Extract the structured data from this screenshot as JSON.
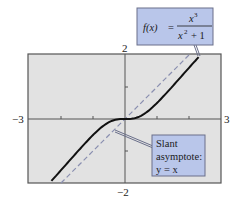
{
  "chart_data": {
    "type": "line",
    "title": "",
    "xlabel": "",
    "ylabel": "",
    "xlim": [
      -3,
      3
    ],
    "ylim": [
      -2,
      2
    ],
    "grid": false,
    "tick_labels": {
      "x_min": "−3",
      "x_max": "3",
      "y_max": "2",
      "y_min": "−2"
    },
    "x_ticks": [
      -3,
      -2,
      -1,
      0,
      1,
      2,
      3
    ],
    "y_ticks": [
      -2,
      -1,
      0,
      1,
      2
    ],
    "series": [
      {
        "name": "f(x) = x^3/(x^2+1)",
        "style": "solid",
        "color": "#111111",
        "x": [
          -2.3,
          -2.0,
          -1.5,
          -1.0,
          -0.5,
          0.0,
          0.5,
          1.0,
          1.5,
          2.0,
          2.3
        ],
        "values": [
          -1.93,
          -1.6,
          -1.04,
          -0.5,
          -0.1,
          0.0,
          0.1,
          0.5,
          1.04,
          1.6,
          1.93
        ]
      },
      {
        "name": "Slant asymptote: y = x",
        "style": "dashed",
        "color": "#8a8fb0",
        "x": [
          -2.0,
          2.0
        ],
        "values": [
          -2.0,
          2.0
        ]
      }
    ],
    "annotations": [
      {
        "id": "function-label",
        "text": "f(x) = x³ / (x² + 1)",
        "points_to": [
          2.3,
          2.0
        ]
      },
      {
        "id": "asymptote-label",
        "text": "Slant asymptote: y = x",
        "points_to": [
          -0.3,
          -0.3
        ]
      }
    ]
  },
  "labels": {
    "x_min": "−3",
    "x_max": "3",
    "y_max": "2",
    "y_min": "−2",
    "fx_lhs": "f(x)",
    "fx_eq": "=",
    "fx_num": "x",
    "fx_num_exp": "3",
    "fx_den": "x",
    "fx_den_exp": "2",
    "fx_den_rest": "+ 1",
    "asym_line1": "Slant",
    "asym_line2": "asymptote:",
    "asym_line3": "y = x"
  },
  "colors": {
    "plot_bg": "#e2e2e2",
    "frame": "#555555",
    "axis": "#555555",
    "curve": "#111111",
    "asymptote": "#8a8fb0",
    "callout_bg": "#b9c6ea",
    "callout_border": "#6a6f8a"
  }
}
